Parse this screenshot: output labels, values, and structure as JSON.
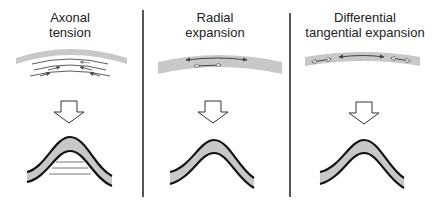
{
  "diagram": {
    "panels": [
      {
        "id": "axonal-tension",
        "title_line1": "Axonal",
        "title_line2": "tension",
        "mechanism": "curved arrows beneath the tissue sheet pulling inward (tension along axons)",
        "result": "fold with horizontal tension lines beneath the crest"
      },
      {
        "id": "radial-expansion",
        "title_line1": "Radial",
        "title_line2": "expansion",
        "mechanism": "two stacked double-headed arrows within the sheet (outer longer, inner shorter)",
        "result": "plain fold"
      },
      {
        "id": "differential-tangential-expansion",
        "title_line1": "Differential",
        "title_line2": "tangential expansion",
        "mechanism": "three double-headed arrows along the sheet: small open arrows at sides, larger filled arrow at center",
        "result": "plain fold"
      }
    ],
    "colors": {
      "tissue_fill": "#c8c8c8",
      "outline": "#111111",
      "divider": "#555555",
      "text": "#222222",
      "background": "#ffffff"
    },
    "arrow_down_label": "leads to"
  }
}
